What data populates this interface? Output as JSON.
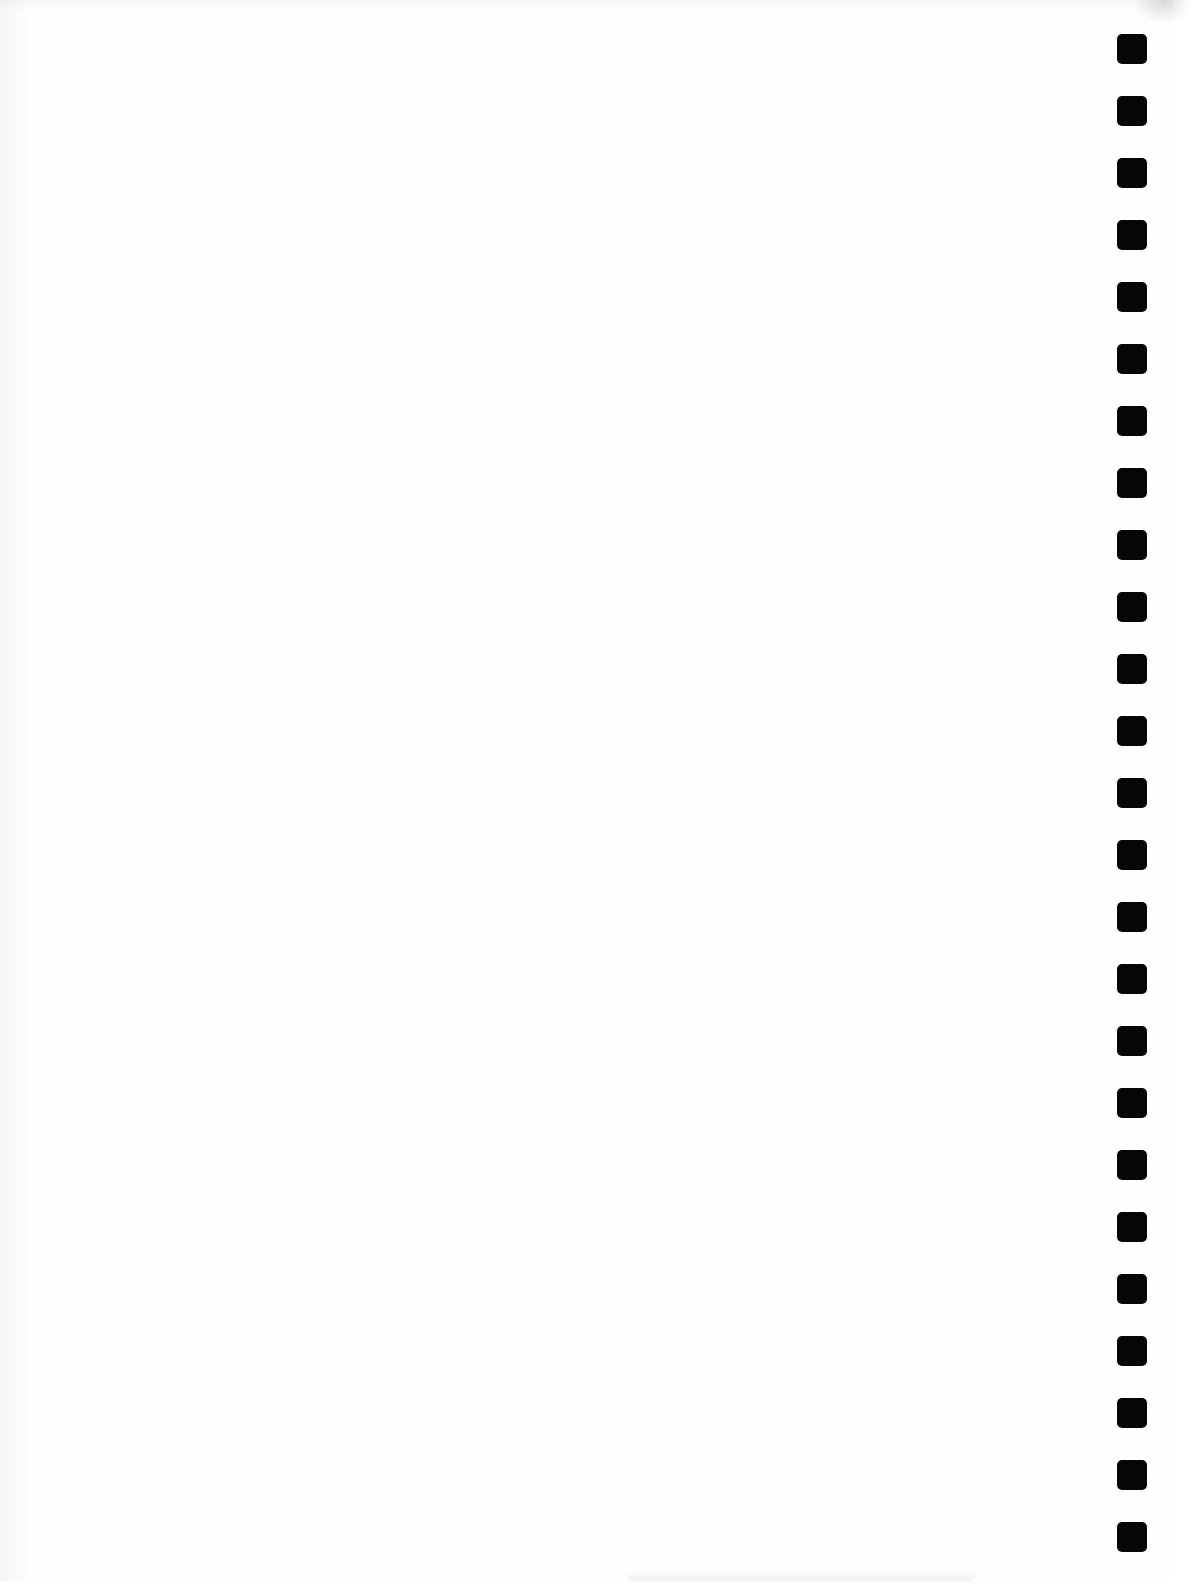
{
  "document": {
    "type": "blank-page-with-binding-holes",
    "background_color": "#fefefe",
    "hole_color": "#060606",
    "hole_count": 25,
    "holes": [
      {
        "index": 1
      },
      {
        "index": 2
      },
      {
        "index": 3
      },
      {
        "index": 4
      },
      {
        "index": 5
      },
      {
        "index": 6
      },
      {
        "index": 7
      },
      {
        "index": 8
      },
      {
        "index": 9
      },
      {
        "index": 10
      },
      {
        "index": 11
      },
      {
        "index": 12
      },
      {
        "index": 13
      },
      {
        "index": 14
      },
      {
        "index": 15
      },
      {
        "index": 16
      },
      {
        "index": 17
      },
      {
        "index": 18
      },
      {
        "index": 19
      },
      {
        "index": 20
      },
      {
        "index": 21
      },
      {
        "index": 22
      },
      {
        "index": 23
      },
      {
        "index": 24
      },
      {
        "index": 25
      }
    ]
  }
}
